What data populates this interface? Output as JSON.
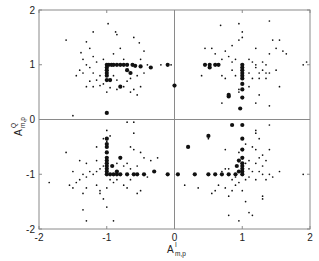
{
  "chart_data": {
    "type": "scatter",
    "title": "",
    "xlabel": "A^I_{m,p}",
    "ylabel": "A^Q_{m,p}",
    "xlabel_main": "A",
    "xlabel_sup": "I",
    "xlabel_sub": "m,p",
    "ylabel_main": "A",
    "ylabel_sup": "Q",
    "ylabel_sub": "m,p",
    "xlim": [
      -2,
      2
    ],
    "ylim": [
      -2,
      2
    ],
    "xticks": [
      "-2",
      "-1",
      "0",
      "1",
      "2"
    ],
    "yticks": [
      "-2",
      "-1",
      "0",
      "1",
      "2"
    ],
    "grid": false,
    "zero_lines": true,
    "legend": null,
    "series": [
      {
        "name": "large-markers",
        "marker": "filled-circle-large",
        "points": [
          [
            -1,
            1
          ],
          [
            -0.97,
            1
          ],
          [
            -0.93,
            1
          ],
          [
            -0.9,
            1
          ],
          [
            -0.85,
            1
          ],
          [
            -0.8,
            1
          ],
          [
            -0.75,
            1
          ],
          [
            -0.7,
            1
          ],
          [
            -0.62,
            1
          ],
          [
            -0.5,
            0.97
          ],
          [
            -0.35,
            0.95
          ],
          [
            -0.1,
            1
          ],
          [
            0.0,
            0.62
          ],
          [
            -1,
            0.95
          ],
          [
            -1,
            0.9
          ],
          [
            -1,
            0.85
          ],
          [
            -1,
            0.8
          ],
          [
            -1,
            0.72
          ],
          [
            -1,
            0.12
          ],
          [
            -0.95,
            0.72
          ],
          [
            -0.7,
            0.9
          ],
          [
            -0.65,
            0.85
          ],
          [
            -0.8,
            0.6
          ],
          [
            1,
            1
          ],
          [
            1,
            0.95
          ],
          [
            1,
            0.9
          ],
          [
            1,
            0.85
          ],
          [
            1,
            0.8
          ],
          [
            1,
            0.75
          ],
          [
            1,
            0.65
          ],
          [
            1,
            0.55
          ],
          [
            1,
            0.4
          ],
          [
            0.65,
            1
          ],
          [
            0.6,
            1
          ],
          [
            0.52,
            1
          ],
          [
            0.45,
            1
          ],
          [
            0.52,
            0.95
          ],
          [
            0.8,
            0.45
          ],
          [
            0.8,
            0.42
          ],
          [
            0.97,
            0.2
          ],
          [
            -0.58,
            0.98
          ],
          [
            -1,
            -1
          ],
          [
            -1,
            -0.95
          ],
          [
            -1,
            -0.9
          ],
          [
            -1,
            -0.85
          ],
          [
            -1,
            -0.8
          ],
          [
            -1,
            -0.75
          ],
          [
            -1,
            -0.7
          ],
          [
            -1,
            -0.6
          ],
          [
            -1,
            -0.5
          ],
          [
            -1,
            -0.45
          ],
          [
            -1,
            -0.35
          ],
          [
            -0.95,
            -1
          ],
          [
            -0.9,
            -1
          ],
          [
            -0.85,
            -1
          ],
          [
            -0.8,
            -1
          ],
          [
            -0.7,
            -1
          ],
          [
            -0.6,
            -1
          ],
          [
            -0.55,
            -1
          ],
          [
            -0.45,
            -1
          ],
          [
            -0.3,
            -0.95
          ],
          [
            -0.8,
            -0.7
          ],
          [
            -0.92,
            -0.85
          ],
          [
            -0.85,
            -0.95
          ],
          [
            1,
            -1
          ],
          [
            1,
            -0.95
          ],
          [
            1,
            -0.9
          ],
          [
            1,
            -0.85
          ],
          [
            1,
            -0.8
          ],
          [
            1,
            -0.7
          ],
          [
            1,
            -0.55
          ],
          [
            1,
            -0.35
          ],
          [
            0.9,
            -1
          ],
          [
            0.95,
            -0.95
          ],
          [
            0.92,
            -0.85
          ],
          [
            0.8,
            -1
          ],
          [
            0.7,
            -1
          ],
          [
            0.6,
            -1
          ],
          [
            0.5,
            -1
          ],
          [
            0.3,
            -1
          ],
          [
            0.05,
            -1
          ],
          [
            -0.1,
            -1
          ],
          [
            0.2,
            -0.5
          ],
          [
            0.5,
            -0.3
          ],
          [
            0.85,
            -0.1
          ],
          [
            1,
            -0.1
          ],
          [
            0.95,
            -0.75
          ]
        ]
      },
      {
        "name": "small-markers",
        "marker": "dot-small",
        "points": [
          [
            -1.6,
            1.45
          ],
          [
            -1.45,
            0.8
          ],
          [
            -0.98,
            1.75
          ],
          [
            -0.87,
            1.6
          ],
          [
            -0.85,
            1.55
          ],
          [
            -1.2,
            1.6
          ],
          [
            -1.3,
            1.42
          ],
          [
            -0.6,
            1.5
          ],
          [
            -0.52,
            1.4
          ],
          [
            -0.45,
            1.25
          ],
          [
            -0.5,
            1.1
          ],
          [
            -1.25,
            1.3
          ],
          [
            -1.2,
            1.15
          ],
          [
            -1.15,
            1.05
          ],
          [
            -1.05,
            1.1
          ],
          [
            -0.9,
            1.2
          ],
          [
            -0.8,
            1.3
          ],
          [
            -0.75,
            1.1
          ],
          [
            -1.38,
            1.22
          ],
          [
            -1.35,
            1.1
          ],
          [
            -1.3,
            1.0
          ],
          [
            -1.25,
            0.95
          ],
          [
            -1.4,
            0.9
          ],
          [
            -1.35,
            0.85
          ],
          [
            -1.2,
            0.85
          ],
          [
            -1.1,
            0.8
          ],
          [
            -1.15,
            0.72
          ],
          [
            -1.25,
            0.7
          ],
          [
            -1.05,
            0.65
          ],
          [
            -1.1,
            0.62
          ],
          [
            -0.95,
            0.58
          ],
          [
            -0.85,
            0.55
          ],
          [
            -0.75,
            0.6
          ],
          [
            -0.7,
            0.7
          ],
          [
            -0.65,
            0.75
          ],
          [
            -0.55,
            0.8
          ],
          [
            -0.45,
            0.85
          ],
          [
            -0.5,
            0.6
          ],
          [
            -0.55,
            0.45
          ],
          [
            -0.65,
            0.5
          ],
          [
            -0.85,
            0.72
          ],
          [
            -0.9,
            0.8
          ],
          [
            -1.2,
            0.6
          ],
          [
            -1.3,
            0.6
          ],
          [
            -1.0,
            0.5
          ],
          [
            -0.6,
            0.55
          ],
          [
            -0.4,
            1.0
          ],
          [
            -0.2,
            1.0
          ],
          [
            -0.05,
            1.0
          ],
          [
            -1.5,
            0.07
          ],
          [
            -0.7,
            -0.05
          ],
          [
            0.45,
            1.3
          ],
          [
            0.55,
            1.3
          ],
          [
            0.6,
            1.2
          ],
          [
            0.75,
            1.25
          ],
          [
            0.85,
            1.35
          ],
          [
            0.95,
            1.45
          ],
          [
            1.0,
            1.6
          ],
          [
            1.0,
            1.5
          ],
          [
            0.95,
            1.75
          ],
          [
            0.68,
            1.72
          ],
          [
            1.4,
            1.8
          ],
          [
            1.2,
            1.3
          ],
          [
            1.4,
            1.2
          ],
          [
            1.5,
            1.3
          ],
          [
            1.45,
            1.45
          ],
          [
            1.55,
            1.45
          ],
          [
            1.6,
            1.25
          ],
          [
            1.65,
            1.2
          ],
          [
            0.7,
            1.1
          ],
          [
            0.8,
            1.15
          ],
          [
            0.85,
            1.05
          ],
          [
            0.9,
            1.1
          ],
          [
            1.1,
            1.1
          ],
          [
            1.15,
            1.05
          ],
          [
            1.2,
            1.0
          ],
          [
            1.3,
            1.05
          ],
          [
            1.35,
            1.0
          ],
          [
            1.3,
            0.9
          ],
          [
            1.25,
            0.85
          ],
          [
            1.35,
            0.85
          ],
          [
            1.2,
            0.95
          ],
          [
            1.1,
            0.85
          ],
          [
            1.15,
            0.75
          ],
          [
            1.25,
            0.75
          ],
          [
            1.35,
            0.75
          ],
          [
            1.4,
            0.85
          ],
          [
            1.5,
            0.9
          ],
          [
            0.85,
            0.9
          ],
          [
            0.9,
            0.8
          ],
          [
            0.75,
            0.75
          ],
          [
            0.7,
            0.8
          ],
          [
            1.1,
            0.6
          ],
          [
            1.25,
            0.45
          ],
          [
            1.55,
            0.6
          ],
          [
            1.4,
            0.25
          ],
          [
            0.7,
            0.3
          ],
          [
            0.95,
            0.55
          ],
          [
            0.95,
            0.5
          ],
          [
            1.2,
            0.3
          ],
          [
            1.9,
            1.0
          ],
          [
            1.95,
            1.05
          ],
          [
            0.4,
            0.8
          ],
          [
            -0.6,
            -0.05
          ],
          [
            -1.0,
            -0.2
          ],
          [
            -0.95,
            -0.3
          ],
          [
            -1.05,
            -0.35
          ],
          [
            -1.0,
            -0.4
          ],
          [
            -1.15,
            -0.5
          ],
          [
            -0.65,
            -0.5
          ],
          [
            -0.6,
            -0.55
          ],
          [
            -0.5,
            -0.6
          ],
          [
            -0.45,
            -0.7
          ],
          [
            -1.15,
            -0.75
          ],
          [
            -0.85,
            -0.8
          ],
          [
            -0.75,
            -0.85
          ],
          [
            -0.7,
            -0.8
          ],
          [
            -0.65,
            -0.9
          ],
          [
            -0.55,
            -0.85
          ],
          [
            -1.05,
            -0.85
          ],
          [
            -1.1,
            -0.9
          ],
          [
            -1.15,
            -0.95
          ],
          [
            -1.25,
            -0.95
          ],
          [
            -1.2,
            -1.0
          ],
          [
            -1.3,
            -1.05
          ],
          [
            -1.35,
            -1.0
          ],
          [
            -1.4,
            -1.1
          ],
          [
            -1.45,
            -1.15
          ],
          [
            -1.5,
            -0.95
          ],
          [
            -1.55,
            -1.2
          ],
          [
            -1.5,
            -1.25
          ],
          [
            -1.85,
            -1.15
          ],
          [
            -1.35,
            -1.35
          ],
          [
            -1.3,
            -1.25
          ],
          [
            -1.15,
            -1.2
          ],
          [
            -1.1,
            -1.3
          ],
          [
            -1.1,
            -1.35
          ],
          [
            -1.05,
            -1.45
          ],
          [
            -1.0,
            -1.25
          ],
          [
            -0.95,
            -1.1
          ],
          [
            -0.9,
            -1.15
          ],
          [
            -0.85,
            -1.1
          ],
          [
            -0.75,
            -1.2
          ],
          [
            -0.7,
            -1.25
          ],
          [
            -0.65,
            -1.1
          ],
          [
            -0.55,
            -1.35
          ],
          [
            -0.5,
            -1.3
          ],
          [
            -0.4,
            -1.05
          ],
          [
            -0.35,
            -0.75
          ],
          [
            -0.25,
            -0.7
          ],
          [
            -1.0,
            -1.6
          ],
          [
            -0.9,
            -1.85
          ],
          [
            -1.35,
            -1.65
          ],
          [
            -1.3,
            -1.85
          ],
          [
            -1.6,
            -0.6
          ],
          [
            -1.4,
            -0.75
          ],
          [
            -1.3,
            -0.8
          ],
          [
            -0.6,
            -0.25
          ],
          [
            1.4,
            -0.1
          ],
          [
            1.2,
            -0.25
          ],
          [
            1.25,
            -0.35
          ],
          [
            1.05,
            -0.45
          ],
          [
            1.15,
            -0.5
          ],
          [
            1.2,
            -0.55
          ],
          [
            0.95,
            -0.6
          ],
          [
            0.75,
            -0.55
          ],
          [
            1.25,
            -0.7
          ],
          [
            1.3,
            -0.65
          ],
          [
            1.35,
            -0.75
          ],
          [
            1.3,
            -0.85
          ],
          [
            1.2,
            -0.8
          ],
          [
            1.1,
            -0.75
          ],
          [
            1.05,
            -0.8
          ],
          [
            1.1,
            -0.9
          ],
          [
            1.15,
            -0.95
          ],
          [
            1.25,
            -0.95
          ],
          [
            1.3,
            -1.0
          ],
          [
            1.4,
            -1.0
          ],
          [
            1.45,
            -1.05
          ],
          [
            1.55,
            -0.95
          ],
          [
            1.35,
            -1.1
          ],
          [
            1.2,
            -1.1
          ],
          [
            1.1,
            -1.05
          ],
          [
            1.05,
            -1.1
          ],
          [
            0.9,
            -1.05
          ],
          [
            0.85,
            -1.1
          ],
          [
            0.8,
            -0.9
          ],
          [
            0.75,
            -0.9
          ],
          [
            0.7,
            -0.95
          ],
          [
            0.65,
            -1.2
          ],
          [
            0.6,
            -1.3
          ],
          [
            0.55,
            -1.35
          ],
          [
            0.75,
            -1.25
          ],
          [
            0.85,
            -1.3
          ],
          [
            0.8,
            -1.4
          ],
          [
            0.9,
            -1.2
          ],
          [
            0.95,
            -1.15
          ],
          [
            1.0,
            -1.3
          ],
          [
            1.05,
            -1.5
          ],
          [
            1.1,
            -1.7
          ],
          [
            1.15,
            -1.75
          ],
          [
            0.8,
            -1.75
          ],
          [
            0.95,
            -1.85
          ],
          [
            1.3,
            -1.4
          ],
          [
            1.3,
            -1.45
          ],
          [
            0.35,
            -1.25
          ],
          [
            0.15,
            -1.2
          ],
          [
            1.9,
            -1.0
          ],
          [
            1.4,
            -0.55
          ],
          [
            0.5,
            -0.35
          ],
          [
            1.2,
            -0.2
          ]
        ]
      }
    ]
  },
  "style": {
    "frame_color": "#8a8a8a",
    "marker_color": "#111111",
    "text_color": "#222222"
  }
}
